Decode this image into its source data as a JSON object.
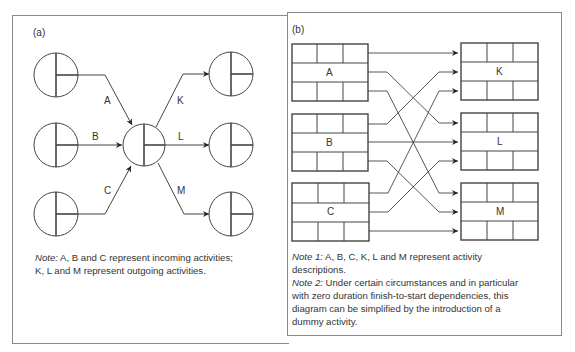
{
  "panel_a": {
    "label": "(a)",
    "incoming": [
      "A",
      "B",
      "C"
    ],
    "outgoing": [
      "K",
      "L",
      "M"
    ],
    "note_prefix": "Note:",
    "note_line1": " A, B and C represent incoming activities;",
    "note_line2": "K, L and M represent outgoing activities."
  },
  "panel_b": {
    "label": "(b)",
    "left_boxes": [
      "A",
      "B",
      "C"
    ],
    "right_boxes": [
      "K",
      "L",
      "M"
    ],
    "note1_prefix": "Note 1:",
    "note1_text": " A, B, C, K, L and M represent activity",
    "note1_line2": "descriptions.",
    "note2_prefix": "Note 2:",
    "note2_text": " Under certain circumstances and in particular",
    "note2_line2": "with zero duration finish-to-start dependencies, this",
    "note2_line3": "diagram can be simplified by the introduction of a",
    "note2_line4": "dummy activity."
  },
  "colors": {
    "line": "#3a3a3a",
    "border": "#8a8a8a"
  }
}
